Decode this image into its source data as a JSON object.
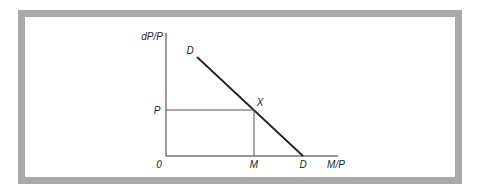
{
  "diagram": {
    "y_axis_label": "dP/P",
    "x_axis_label": "M/P",
    "origin_label": "0",
    "curve_label_top": "D",
    "curve_label_bottom": "D",
    "point_label": "X",
    "y_point_label": "P",
    "x_point_label": "M",
    "colors": {
      "frame": "#a9a9a9",
      "line": "#222222",
      "guide": "#555555",
      "background": "#ffffff"
    }
  }
}
